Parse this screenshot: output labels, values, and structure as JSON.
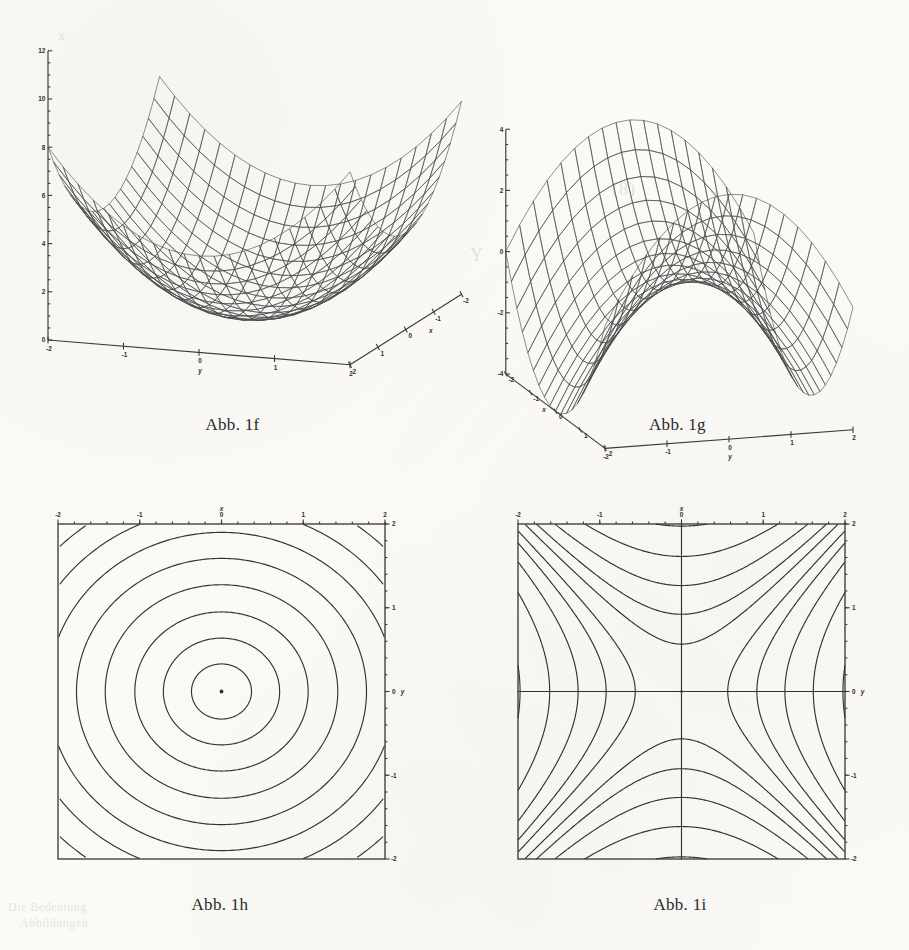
{
  "page": {
    "kind": "scanned-textbook-figure-page",
    "background_hex": "#fbfaf7",
    "ink_hex": "#333333"
  },
  "ghost_text": [
    {
      "text": "(8)",
      "x": 612,
      "y": 178,
      "size": 19
    },
    {
      "text": "b",
      "x": 690,
      "y": 252,
      "size": 20
    },
    {
      "text": "x",
      "x": 58,
      "y": 28,
      "size": 14
    },
    {
      "text": "Y",
      "x": 470,
      "y": 245,
      "size": 18
    },
    {
      "text": "Die Bedeutung",
      "x": 8,
      "y": 900,
      "size": 12
    },
    {
      "text": "Abbildungen",
      "x": 20,
      "y": 916,
      "size": 12
    }
  ],
  "figures": [
    {
      "id": "fig-1f",
      "caption": "Abb. 1f",
      "type": "surface3d",
      "surface": "elliptic-paraboloid",
      "formula": "z = x^2 + y^2",
      "axes": {
        "z": {
          "label": "",
          "ticks": [
            "0",
            "2",
            "4",
            "6",
            "8",
            "10",
            "12"
          ],
          "min": 0,
          "max": 12
        },
        "y": {
          "label": "y",
          "ticks": [
            "-2",
            "-1",
            "0",
            "1",
            "2"
          ],
          "min": -2,
          "max": 2
        },
        "x": {
          "label": "x",
          "ticks": [
            "2",
            "1",
            "0",
            "-1",
            "-2"
          ],
          "min": -2,
          "max": 2
        }
      },
      "mesh": {
        "u_divisions": 20,
        "v_divisions": 20
      }
    },
    {
      "id": "fig-1g",
      "caption": "Abb. 1g",
      "type": "surface3d",
      "surface": "hyperbolic-paraboloid",
      "formula": "z = x^2 - y^2",
      "axes": {
        "z": {
          "label": "",
          "ticks": [
            "-4",
            "-2",
            "0",
            "2",
            "4"
          ],
          "min": -4,
          "max": 4
        },
        "x": {
          "label": "x",
          "ticks": [
            "-2",
            "-1",
            "0",
            "1",
            "2"
          ],
          "min": -2,
          "max": 2
        },
        "y": {
          "label": "y",
          "ticks": [
            "-2",
            "-1",
            "0",
            "1",
            "2"
          ],
          "min": -2,
          "max": 2
        }
      },
      "mesh": {
        "u_divisions": 18,
        "v_divisions": 18
      }
    },
    {
      "id": "fig-1h",
      "caption": "Abb. 1h",
      "type": "contour",
      "surface": "elliptic-paraboloid",
      "formula": "x^2 + y^2 = c",
      "axes": {
        "x": {
          "label": "x",
          "position": "top",
          "ticks": [
            "-2",
            "-1",
            "0",
            "1",
            "2"
          ],
          "min": -2,
          "max": 2
        },
        "y": {
          "label": "y",
          "position": "right",
          "ticks": [
            "2",
            "1",
            "0",
            "-1",
            "-2"
          ],
          "min": -2,
          "max": 2
        }
      },
      "levels": [
        0.12,
        0.45,
        1.0,
        1.8,
        2.8,
        4.0,
        5.3,
        6.8,
        8.4,
        10.1,
        11.9,
        13.8,
        15.7,
        17.6,
        19.5
      ],
      "center_marker": true
    },
    {
      "id": "fig-1i",
      "caption": "Abb. 1i",
      "type": "contour",
      "surface": "hyperbolic-paraboloid",
      "formula": "x^2 - y^2 = c",
      "axes": {
        "x": {
          "label": "x",
          "position": "top",
          "ticks": [
            "-2",
            "-1",
            "0",
            "1",
            "2"
          ],
          "min": -2,
          "max": 2
        },
        "y": {
          "label": "y",
          "position": "right",
          "ticks": [
            "2",
            "1",
            "0",
            "-1",
            "-2"
          ],
          "min": -2,
          "max": 2
        }
      },
      "levels": [
        -7.2,
        -5.4,
        -3.9,
        -2.6,
        -1.6,
        -0.85,
        -0.32,
        0,
        0.32,
        0.85,
        1.6,
        2.6,
        3.9,
        5.4,
        7.2
      ],
      "center_marker": true
    }
  ],
  "chart_data": [
    {
      "type": "line",
      "id": "fig-1f",
      "title": "Abb. 1f",
      "render": "3d-wireframe-surface",
      "function": "z = x^2 + y^2",
      "xlabel": "x",
      "ylabel": "y",
      "zlabel": "z",
      "xlim": [
        -2,
        2
      ],
      "ylim": [
        -2,
        2
      ],
      "zlim": [
        0,
        12
      ],
      "xticks": [
        -2,
        -1,
        0,
        1,
        2
      ],
      "yticks": [
        -2,
        -1,
        0,
        1,
        2
      ],
      "zticks": [
        0,
        2,
        4,
        6,
        8,
        10,
        12
      ],
      "grid": false,
      "legend": null,
      "notes": "Elliptic paraboloid, opening upward; vertex at origin z=0; corners reach z=8; maximum corner value 8 with apex spikes to 12 at axis extremes."
    },
    {
      "type": "line",
      "id": "fig-1g",
      "title": "Abb. 1g",
      "render": "3d-wireframe-surface",
      "function": "z = x^2 - y^2",
      "xlabel": "x",
      "ylabel": "y",
      "zlabel": "z",
      "xlim": [
        -2,
        2
      ],
      "ylim": [
        -2,
        2
      ],
      "zlim": [
        -4,
        4
      ],
      "xticks": [
        -2,
        -1,
        0,
        1,
        2
      ],
      "yticks": [
        -2,
        -1,
        0,
        1,
        2
      ],
      "zticks": [
        -4,
        -2,
        0,
        2,
        4
      ],
      "grid": false,
      "legend": null,
      "notes": "Hyperbolic paraboloid (saddle); z=+4 at (x=+-2,y=0), z=-4 at (x=0,y=+-2), saddle point at origin."
    },
    {
      "type": "line",
      "id": "fig-1h",
      "title": "Abb. 1h",
      "render": "contour-map",
      "function": "x^2 + y^2 = c",
      "xlabel": "x",
      "ylabel": "y",
      "xlim": [
        -2,
        2
      ],
      "ylim": [
        -2,
        2
      ],
      "xticks": [
        -2,
        -1,
        0,
        1,
        2
      ],
      "yticks": [
        -2,
        -1,
        0,
        1,
        2
      ],
      "levels": [
        0.12,
        0.45,
        1.0,
        1.8,
        2.8,
        4.0,
        5.3,
        6.8,
        8.4,
        10.1,
        11.9,
        13.8,
        15.7,
        17.6,
        19.5
      ],
      "grid": false,
      "legend": null,
      "notes": "Concentric closed ovals (circles/ellipses) centred on origin; outermost levels clipped to corners."
    },
    {
      "type": "line",
      "id": "fig-1i",
      "title": "Abb. 1i",
      "render": "contour-map",
      "function": "x^2 - y^2 = c",
      "xlabel": "x",
      "ylabel": "y",
      "xlim": [
        -2,
        2
      ],
      "ylim": [
        -2,
        2
      ],
      "xticks": [
        -2,
        -1,
        0,
        1,
        2
      ],
      "yticks": [
        -2,
        -1,
        0,
        1,
        2
      ],
      "levels": [
        -7.2,
        -5.4,
        -3.9,
        -2.6,
        -1.6,
        -0.85,
        -0.32,
        0,
        0.32,
        0.85,
        1.6,
        2.6,
        3.9,
        5.4,
        7.2
      ],
      "grid": false,
      "legend": null,
      "notes": "Family of hyperbolas with the degenerate level c=0 forming the crossed straight asymptotes x=0 and y=0."
    }
  ]
}
